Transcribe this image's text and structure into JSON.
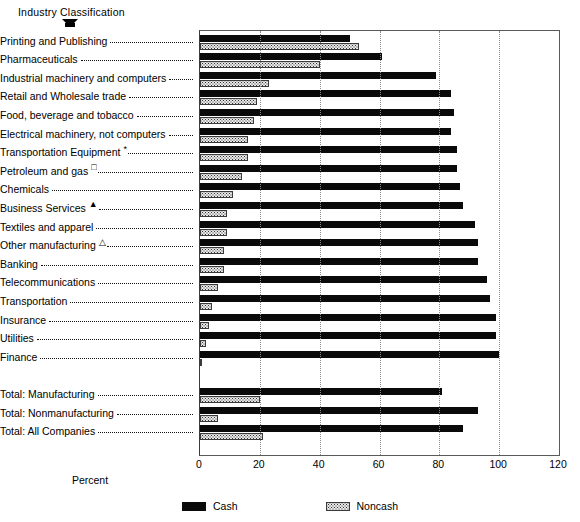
{
  "chart_data": {
    "type": "bar",
    "orientation": "horizontal",
    "title": "",
    "ylabel": "Industry Classification",
    "xlabel": "Percent",
    "xlim": [
      0,
      120
    ],
    "xticks": [
      0,
      20,
      40,
      60,
      80,
      100,
      120
    ],
    "grid": "vertical-dotted",
    "legend_position": "bottom-center",
    "categories": [
      "Printing and Publishing",
      "Pharmaceuticals",
      "Industrial machinery and computers",
      "Retail and Wholesale trade",
      "Food, beverage and tobacco",
      "Electrical machinery, not computers",
      "Transportation Equipment",
      "Petroleum and gas",
      "Chemicals",
      "Business Services",
      "Textiles and apparel",
      "Other manufacturing",
      "Banking",
      "Telecommunications",
      "Transportation",
      "Insurance",
      "Utilities",
      "Finance",
      "",
      "Total: Manufacturing",
      "Total: Nonmanufacturing",
      "Total: All Companies"
    ],
    "category_markers": [
      "",
      "",
      "",
      "",
      "",
      "",
      "*",
      "□",
      "",
      "▲",
      "",
      "△",
      "",
      "",
      "",
      "",
      "",
      "",
      "",
      "",
      "",
      ""
    ],
    "series": [
      {
        "name": "Cash",
        "color": "#0a0a0a",
        "values": [
          50,
          61,
          79,
          84,
          85,
          84,
          86,
          86,
          87,
          88,
          92,
          93,
          93,
          96,
          97,
          99,
          99,
          100,
          null,
          81,
          93,
          88
        ]
      },
      {
        "name": "Noncash",
        "color": "#e8e8e8",
        "values": [
          53,
          40,
          23,
          19,
          18,
          16,
          16,
          14,
          11,
          9,
          9,
          8,
          8,
          6,
          4,
          3,
          2,
          0,
          null,
          20,
          6,
          21
        ]
      }
    ],
    "legend": [
      "Cash",
      "Noncash"
    ]
  },
  "axis": {
    "y_title": "Industry Classification",
    "x_title": "Percent",
    "tick_labels": [
      "0",
      "20",
      "40",
      "60",
      "80",
      "100",
      "120"
    ]
  },
  "legend": {
    "cash_label": "Cash",
    "noncash_label": "Noncash"
  }
}
